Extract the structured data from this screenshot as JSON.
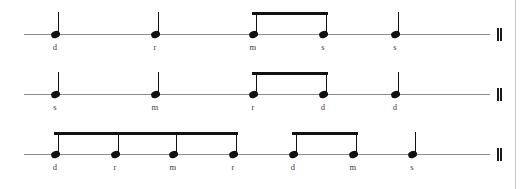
{
  "document": {
    "type": "rhythm-notation-exercise",
    "notation_style": "one-line rhythm staff with solfege syllables",
    "systems_count": 3,
    "colors": {
      "ink": "#111111",
      "staff_line": "#8d8d8d",
      "syllable_text": "#3b3b3b",
      "page_edge": "#c9c9c9",
      "background": "#ffffff"
    }
  },
  "systems": [
    {
      "index": 1,
      "staff": {
        "y": 34,
        "x_start": 24,
        "x_end": 490
      },
      "barline": {
        "type": "double-barline",
        "x": 497
      },
      "notes": [
        {
          "syllable": "d",
          "x": 55,
          "duration": "quarter",
          "beamed": false
        },
        {
          "syllable": "r",
          "x": 155,
          "duration": "quarter",
          "beamed": false
        },
        {
          "syllable": "m",
          "x": 253,
          "duration": "eighth",
          "beamed": true,
          "beam_group": 1
        },
        {
          "syllable": "s",
          "x": 323,
          "duration": "eighth",
          "beamed": true,
          "beam_group": 1
        },
        {
          "syllable": "s",
          "x": 395,
          "duration": "quarter",
          "beamed": false
        }
      ],
      "beams": [
        {
          "group": 1,
          "x_start": 252,
          "x_end": 328
        }
      ]
    },
    {
      "index": 2,
      "staff": {
        "y": 94,
        "x_start": 24,
        "x_end": 490
      },
      "barline": {
        "type": "double-barline",
        "x": 497
      },
      "notes": [
        {
          "syllable": "s",
          "x": 55,
          "duration": "quarter",
          "beamed": false
        },
        {
          "syllable": "m",
          "x": 155,
          "duration": "quarter",
          "beamed": false
        },
        {
          "syllable": "r",
          "x": 253,
          "duration": "eighth",
          "beamed": true,
          "beam_group": 1
        },
        {
          "syllable": "d",
          "x": 323,
          "duration": "eighth",
          "beamed": true,
          "beam_group": 1
        },
        {
          "syllable": "d",
          "x": 395,
          "duration": "quarter",
          "beamed": false
        }
      ],
      "beams": [
        {
          "group": 1,
          "x_start": 252,
          "x_end": 328
        }
      ]
    },
    {
      "index": 3,
      "staff": {
        "y": 154,
        "x_start": 24,
        "x_end": 490
      },
      "barline": {
        "type": "double-barline",
        "x": 497
      },
      "notes": [
        {
          "syllable": "d",
          "x": 55,
          "duration": "eighth",
          "beamed": true,
          "beam_group": 1
        },
        {
          "syllable": "r",
          "x": 115,
          "duration": "eighth",
          "beamed": true,
          "beam_group": 1
        },
        {
          "syllable": "m",
          "x": 173,
          "duration": "eighth",
          "beamed": true,
          "beam_group": 1
        },
        {
          "syllable": "r",
          "x": 233,
          "duration": "eighth",
          "beamed": true,
          "beam_group": 1
        },
        {
          "syllable": "d",
          "x": 293,
          "duration": "eighth",
          "beamed": true,
          "beam_group": 2
        },
        {
          "syllable": "m",
          "x": 353,
          "duration": "eighth",
          "beamed": true,
          "beam_group": 2
        },
        {
          "syllable": "s",
          "x": 412,
          "duration": "quarter",
          "beamed": false
        }
      ],
      "beams": [
        {
          "group": 1,
          "x_start": 54,
          "x_end": 238
        },
        {
          "group": 2,
          "x_start": 292,
          "x_end": 358
        }
      ]
    }
  ],
  "page_edge": {
    "x": 515
  }
}
